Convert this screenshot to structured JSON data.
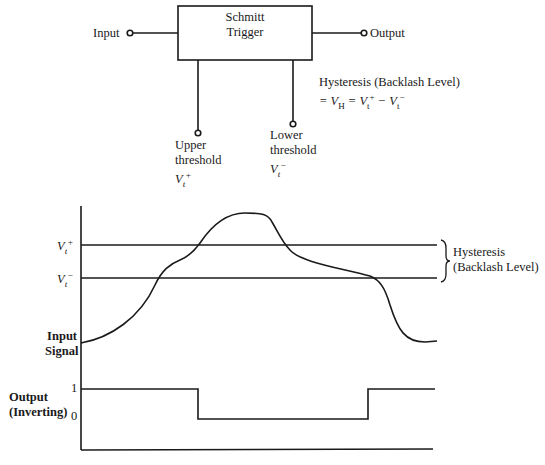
{
  "block_diagram": {
    "block_label_line1": "Schmitt",
    "block_label_line2": "Trigger",
    "input_label": "Input",
    "output_label": "Output",
    "upper_threshold": {
      "line1": "Upper",
      "line2": "threshold",
      "symbol": "V",
      "sub": "t",
      "sup": "+"
    },
    "lower_threshold": {
      "line1": "Lower",
      "line2": "threshold",
      "symbol": "V",
      "sub": "t",
      "sup": "−"
    },
    "hysteresis_title": "Hysteresis (Backlash Level)",
    "hysteresis_eq": {
      "prefix": "= V",
      "h_sub": "H",
      "mid": " = V",
      "t1_sub": "t",
      "t1_sup": "+",
      "minus": " − V",
      "t2_sub": "t",
      "t2_sup": "−"
    }
  },
  "waveform": {
    "vt_plus_label": {
      "symbol": "V",
      "sub": "t",
      "sup": "+"
    },
    "vt_minus_label": {
      "symbol": "V",
      "sub": "t",
      "sup": "−"
    },
    "input_signal_label_line1": "Input",
    "input_signal_label_line2": "Signal",
    "hysteresis_brace_line1": "Hysteresis",
    "hysteresis_brace_line2": "(Backlash Level)",
    "output_label_line1": "Output",
    "output_label_line2": "(Inverting)",
    "output_level_high": "1",
    "output_level_low": "0"
  },
  "colors": {
    "ink": "#1a1a1a",
    "background": "#ffffff"
  }
}
